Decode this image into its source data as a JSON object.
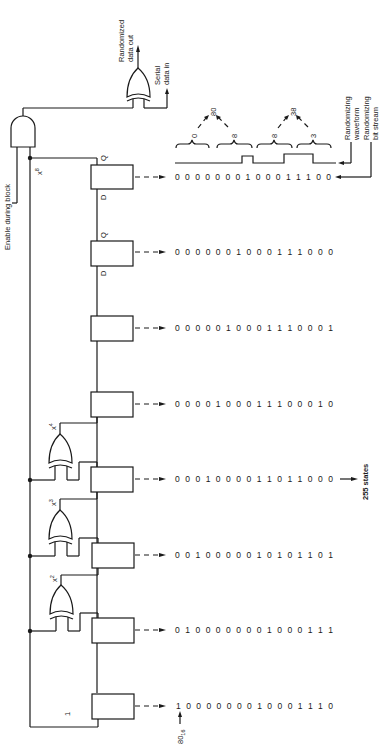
{
  "figure": {
    "orientation": "rotated-90-ccw"
  },
  "labels": {
    "randomized_out": "Randomized data out",
    "randomized_out_l1": "Randomized",
    "randomized_out_l2": "data out",
    "serial_in_l1": "Serial",
    "serial_in_l2": "data in",
    "enable": "Enable during block",
    "waveform_l1": "Randomizing",
    "waveform_l2": "waveform",
    "bitstream_l1": "Randomizing",
    "bitstream_l2": "bit stream",
    "states": "255 states",
    "seed": "80",
    "seed_sub": "16",
    "tap_x8": "x",
    "tap_x8_exp": "8",
    "tap_x4": "x",
    "tap_x4_exp": "4",
    "tap_x3": "x",
    "tap_x3_exp": "3",
    "tap_x2": "x",
    "tap_x2_exp": "2",
    "feedback_one": "1",
    "reg_q": "Q",
    "reg_d": "D"
  },
  "waveform": {
    "groups": [
      {
        "value": "0"
      },
      {
        "value": "8"
      },
      {
        "value": "8"
      },
      {
        "value": "3"
      }
    ],
    "bytes": [
      "80",
      "38"
    ]
  },
  "registers": [
    {
      "stage": "x8",
      "bits": "0000000100011100",
      "bits_display": "0 0 0 0 0 0 0 1 0 0 0 1 1 1 0 0"
    },
    {
      "stage": "7",
      "bits": "0000001000111000",
      "bits_display": "0 0 0 0 0 0 1 0 0 0 1 1 1 0 0 0"
    },
    {
      "stage": "6",
      "bits": "0000010001110001",
      "bits_display": "0 0 0 0 0 1 0 0 0 1 1 1 0 0 0 1"
    },
    {
      "stage": "5",
      "bits": "0000100011100010",
      "bits_display": "0 0 0 0 1 0 0 0 1 1 1 0 0 0 1 0"
    },
    {
      "stage": "4",
      "bits": "0001000011011000",
      "bits_display": "0 0 0 1 0 0 0 0 1 1 0 1 1 0 0 0"
    },
    {
      "stage": "3",
      "bits": "0010000010101101",
      "bits_display": "0 0 1 0 0 0 0 0 1 0 1 0 1 1 0 1"
    },
    {
      "stage": "2",
      "bits": "0100000001000111",
      "bits_display": "0 1 0 0 0 0 0 0 0 1 0 0 0 1 1 1"
    },
    {
      "stage": "1",
      "bits": "1000000010001110",
      "bits_display": "1 0 0 0 0 0 0 0 1 0 0 0 1 1 1 0"
    }
  ]
}
